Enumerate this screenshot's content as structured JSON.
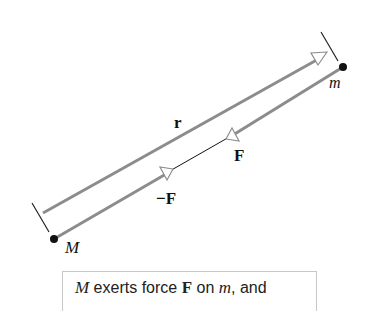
{
  "diagram": {
    "labels": {
      "r": "r",
      "F": "F",
      "negF": "−F",
      "m": "m",
      "M": "M"
    },
    "colors": {
      "vector_line": "#8c8c8c",
      "thin_line": "#111111",
      "dot": "#111111",
      "arrowhead_fill": "#ffffff",
      "caption_border": "#c8c8c8"
    },
    "caption": {
      "part1_M": "M",
      "part2": " exerts force ",
      "part3_F": "F",
      "part4": " on ",
      "part5_m": "m",
      "part6": ", and"
    }
  }
}
